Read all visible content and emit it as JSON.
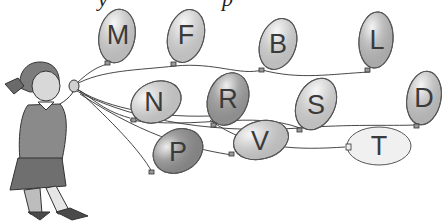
{
  "illustration": {
    "subject": "girl holding balloons",
    "top_text_fragments": [
      "y",
      "p"
    ],
    "balloons": [
      {
        "letter": "M",
        "shade": "#c9c9c9"
      },
      {
        "letter": "F",
        "shade": "#cfcfcf"
      },
      {
        "letter": "B",
        "shade": "#cdcdcd"
      },
      {
        "letter": "L",
        "shade": "#b8b8b8"
      },
      {
        "letter": "N",
        "shade": "#cdcdcd"
      },
      {
        "letter": "R",
        "shade": "#9a9a9a"
      },
      {
        "letter": "S",
        "shade": "#d0d0d0"
      },
      {
        "letter": "D",
        "shade": "#c2c2c2"
      },
      {
        "letter": "P",
        "shade": "#8e8e8e"
      },
      {
        "letter": "V",
        "shade": "#cbcbcb"
      },
      {
        "letter": "T",
        "shade": "#f0f0f0"
      }
    ]
  }
}
